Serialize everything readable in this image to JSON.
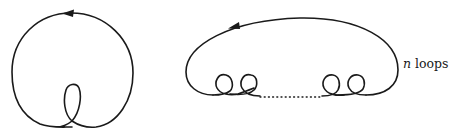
{
  "figures": [
    {
      "id": "single-loop-curve",
      "description": "Closed curve traversed counterclockwise with one interior kink loop at the bottom",
      "arrow_direction": "left"
    },
    {
      "id": "n-loop-curve",
      "description": "Closed curve traversed counterclockwise with n small loops along the bottom edge, middle loops elided by a dotted line",
      "arrow_direction": "left",
      "label": {
        "variable": "n",
        "text": " loops"
      }
    }
  ],
  "colors": {
    "stroke": "#1a1a1a",
    "background": "#ffffff"
  }
}
